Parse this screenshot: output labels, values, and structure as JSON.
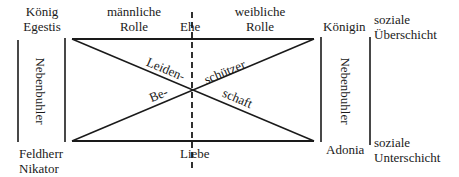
{
  "diagram": {
    "corners": {
      "top_left": [
        "König",
        "Egestis"
      ],
      "top_right": "Königin",
      "bottom_left": [
        "Feldherr",
        "Nikator"
      ],
      "bottom_right": "Adonia"
    },
    "top_labels": {
      "left_role": [
        "männliche",
        "Rolle"
      ],
      "center": "Ehe",
      "right_role": [
        "weibliche",
        "Rolle"
      ]
    },
    "bottom_center": "Liebe",
    "side_labels": {
      "left": "Nebenbuhler",
      "right": "Nebenbuhler"
    },
    "social_class": {
      "upper": [
        "soziale",
        "Überschicht"
      ],
      "lower": [
        "soziale",
        "Unterschicht"
      ]
    },
    "diagonal_labels": {
      "descending_upper": "Leiden-",
      "ascending_upper": "schützer",
      "ascending_lower": "Be-",
      "descending_lower": "schaft"
    },
    "colors": {
      "line": "#1a1a1a",
      "background": "#ffffff"
    }
  }
}
